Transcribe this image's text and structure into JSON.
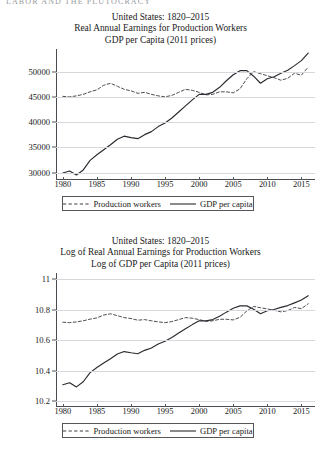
{
  "page": {
    "running_head": "LABOR AND THE PLUTOCRACY"
  },
  "figures": [
    {
      "id": "real-earnings-chart",
      "title_lines": [
        "United States: 1820–2015",
        "Real Annual Earnings for Production Workers",
        "GDP per  Capita (2011 prices)"
      ],
      "legend": [
        {
          "label": "Production workers",
          "style": "dashed"
        },
        {
          "label": "GDP per capita",
          "style": "solid"
        }
      ],
      "chart_data": {
        "type": "line",
        "title": "United States: 1820–2015 — Real Annual Earnings for Production Workers / GDP per Capita (2011 prices)",
        "xlabel": "",
        "ylabel": "",
        "xlim": [
          1979,
          2017
        ],
        "ylim": [
          28500,
          54500
        ],
        "xticks": [
          1980,
          1985,
          1990,
          1995,
          2000,
          2005,
          2010,
          2015
        ],
        "yticks": [
          30000,
          35000,
          40000,
          45000,
          50000
        ],
        "grid": true,
        "legend_position": "below",
        "x": [
          1980,
          1981,
          1982,
          1983,
          1984,
          1985,
          1986,
          1987,
          1988,
          1989,
          1990,
          1991,
          1992,
          1993,
          1994,
          1995,
          1996,
          1997,
          1998,
          1999,
          2000,
          2001,
          2002,
          2003,
          2004,
          2005,
          2006,
          2007,
          2008,
          2009,
          2010,
          2011,
          2012,
          2013,
          2014,
          2015,
          2016
        ],
        "series": [
          {
            "name": "Production workers",
            "style": "dashed",
            "color": "#3a3a40",
            "values": [
              45100,
              45000,
              45200,
              45500,
              46000,
              46400,
              47300,
              47700,
              47100,
              46500,
              46200,
              45700,
              45900,
              45500,
              45200,
              45000,
              45300,
              45900,
              46500,
              46300,
              45900,
              45400,
              45500,
              46000,
              46000,
              45800,
              46600,
              48600,
              50000,
              49600,
              49200,
              48800,
              48300,
              48700,
              49700,
              49300,
              50900
            ]
          },
          {
            "name": "GDP per capita",
            "style": "solid",
            "color": "#2a2a30",
            "values": [
              29900,
              30300,
              29500,
              30500,
              32400,
              33500,
              34500,
              35500,
              36600,
              37200,
              36900,
              36700,
              37500,
              38100,
              39100,
              39800,
              40800,
              42000,
              43200,
              44400,
              45500,
              45500,
              45900,
              46900,
              48200,
              49400,
              50200,
              50200,
              49100,
              47700,
              48600,
              49000,
              49700,
              50300,
              51200,
              52200,
              53700
            ]
          }
        ]
      }
    },
    {
      "id": "log-real-earnings-chart",
      "title_lines": [
        "United States: 1820–2015",
        "Log of Real Annual Earnings for Production Workers",
        "Log of GDP per Capita (2011 prices)"
      ],
      "legend": [
        {
          "label": "Production workers",
          "style": "dashed"
        },
        {
          "label": "GDP per capita",
          "style": "solid"
        }
      ],
      "chart_data": {
        "type": "line",
        "title": "United States: 1820–2015 — Log of Real Annual Earnings for Production Workers / Log of GDP per Capita (2011 prices)",
        "xlabel": "",
        "ylabel": "",
        "xlim": [
          1979,
          2017
        ],
        "ylim": [
          10.16,
          11.04
        ],
        "xticks": [
          1980,
          1985,
          1990,
          1995,
          2000,
          2005,
          2010,
          2015
        ],
        "yticks": [
          "10.2",
          "10.4",
          "10.6",
          "10.8",
          "11"
        ],
        "ytickvalues": [
          10.2,
          10.4,
          10.6,
          10.8,
          11
        ],
        "grid": true,
        "legend_position": "below",
        "x": [
          1980,
          1981,
          1982,
          1983,
          1984,
          1985,
          1986,
          1987,
          1988,
          1989,
          1990,
          1991,
          1992,
          1993,
          1994,
          1995,
          1996,
          1997,
          1998,
          1999,
          2000,
          2001,
          2002,
          2003,
          2004,
          2005,
          2006,
          2007,
          2008,
          2009,
          2010,
          2011,
          2012,
          2013,
          2014,
          2015,
          2016
        ],
        "series": [
          {
            "name": "Production workers",
            "style": "dashed",
            "color": "#3a3a40",
            "values": [
              10.717,
              10.714,
              10.719,
              10.726,
              10.737,
              10.745,
              10.764,
              10.772,
              10.76,
              10.747,
              10.741,
              10.73,
              10.734,
              10.726,
              10.719,
              10.714,
              10.721,
              10.734,
              10.747,
              10.743,
              10.734,
              10.723,
              10.726,
              10.736,
              10.736,
              10.732,
              10.749,
              10.791,
              10.82,
              10.812,
              10.804,
              10.795,
              10.785,
              10.793,
              10.814,
              10.806,
              10.838
            ]
          },
          {
            "name": "GDP per capita",
            "style": "solid",
            "color": "#2a2a30",
            "values": [
              10.306,
              10.319,
              10.292,
              10.326,
              10.386,
              10.419,
              10.449,
              10.477,
              10.508,
              10.524,
              10.516,
              10.51,
              10.532,
              10.548,
              10.574,
              10.592,
              10.617,
              10.646,
              10.674,
              10.701,
              10.726,
              10.726,
              10.734,
              10.756,
              10.783,
              10.808,
              10.824,
              10.824,
              10.802,
              10.773,
              10.792,
              10.8,
              10.814,
              10.826,
              10.844,
              10.863,
              10.891
            ]
          }
        ]
      }
    }
  ]
}
